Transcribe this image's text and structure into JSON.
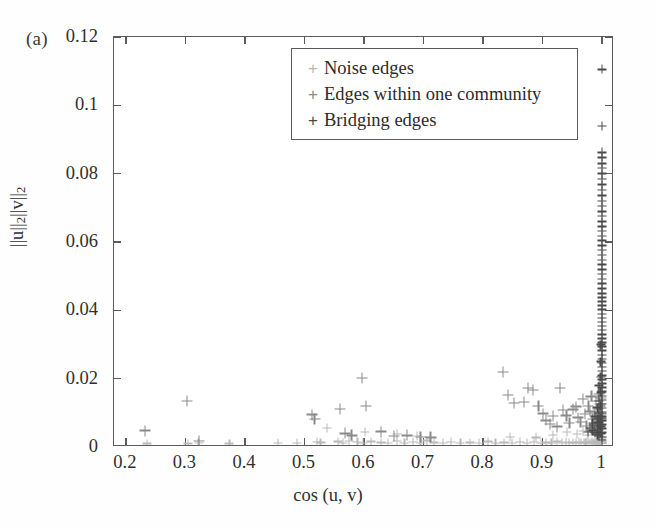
{
  "panel": {
    "letter": "(a)"
  },
  "chart_data": {
    "type": "scatter",
    "title": "",
    "xlabel": "cos (u, v)",
    "ylabel": "||u||2||v||2",
    "xlim": [
      0.18,
      1.02
    ],
    "ylim": [
      0,
      0.12
    ],
    "grid": false,
    "legend_position": "top-center",
    "xticks": [
      "0.2",
      "0.3",
      "0.4",
      "0.5",
      "0.6",
      "0.7",
      "0.8",
      "0.9",
      "1"
    ],
    "xtickvalues": [
      0.2,
      0.3,
      0.4,
      0.5,
      0.6,
      0.7,
      0.8,
      0.9,
      1.0
    ],
    "yticks": [
      "0",
      "0.02",
      "0.04",
      "0.06",
      "0.08",
      "0.1",
      "0.12"
    ],
    "ytickvalues": [
      0,
      0.02,
      0.04,
      0.06,
      0.08,
      0.1,
      0.12
    ],
    "series": [
      {
        "name": "Noise edges",
        "color": "#b9b9b9",
        "marker": "+",
        "points": [
          [
            0.455,
            0.0012
          ],
          [
            0.488,
            0.0011
          ],
          [
            0.521,
            0.0015
          ],
          [
            0.527,
            0.0013
          ],
          [
            0.556,
            0.0016
          ],
          [
            0.565,
            0.0012
          ],
          [
            0.575,
            0.0018
          ],
          [
            0.589,
            0.0014
          ],
          [
            0.598,
            0.0011
          ],
          [
            0.612,
            0.0016
          ],
          [
            0.628,
            0.0013
          ],
          [
            0.641,
            0.0012
          ],
          [
            0.655,
            0.0017
          ],
          [
            0.668,
            0.0012
          ],
          [
            0.682,
            0.0014
          ],
          [
            0.695,
            0.0011
          ],
          [
            0.706,
            0.0019
          ],
          [
            0.718,
            0.0013
          ],
          [
            0.733,
            0.0012
          ],
          [
            0.746,
            0.0015
          ],
          [
            0.762,
            0.0011
          ],
          [
            0.778,
            0.0013
          ],
          [
            0.793,
            0.0012
          ],
          [
            0.808,
            0.0016
          ],
          [
            0.821,
            0.0012
          ],
          [
            0.835,
            0.0013
          ],
          [
            0.849,
            0.0011
          ],
          [
            0.862,
            0.0015
          ],
          [
            0.874,
            0.0012
          ],
          [
            0.886,
            0.0014
          ],
          [
            0.897,
            0.0011
          ],
          [
            0.906,
            0.0013
          ],
          [
            0.915,
            0.0012
          ],
          [
            0.924,
            0.0016
          ],
          [
            0.932,
            0.0012
          ],
          [
            0.939,
            0.0014
          ],
          [
            0.945,
            0.0011
          ],
          [
            0.951,
            0.0013
          ],
          [
            0.956,
            0.0012
          ],
          [
            0.961,
            0.0015
          ],
          [
            0.965,
            0.0011
          ],
          [
            0.969,
            0.0013
          ],
          [
            0.972,
            0.0012
          ],
          [
            0.975,
            0.0014
          ],
          [
            0.978,
            0.0011
          ],
          [
            0.981,
            0.0012
          ],
          [
            0.983,
            0.0016
          ],
          [
            0.985,
            0.0012
          ],
          [
            0.987,
            0.0013
          ],
          [
            0.989,
            0.0011
          ],
          [
            0.991,
            0.0014
          ],
          [
            0.992,
            0.0012
          ],
          [
            0.993,
            0.0017
          ],
          [
            0.994,
            0.0012
          ],
          [
            0.995,
            0.0013
          ],
          [
            0.996,
            0.0011
          ],
          [
            0.9965,
            0.0019
          ],
          [
            0.997,
            0.0012
          ],
          [
            0.9975,
            0.0015
          ],
          [
            0.998,
            0.0011
          ],
          [
            0.9985,
            0.0022
          ],
          [
            0.999,
            0.0013
          ],
          [
            0.9993,
            0.0011
          ],
          [
            0.9996,
            0.0026
          ],
          [
            0.9998,
            0.0014
          ],
          [
            1.0,
            0.0011
          ],
          [
            1.0,
            0.0018
          ],
          [
            1.0,
            0.003
          ],
          [
            0.236,
            0.001
          ],
          [
            0.305,
            0.001
          ],
          [
            0.322,
            0.0011
          ],
          [
            0.374,
            0.001
          ],
          [
            0.538,
            0.0055
          ],
          [
            0.601,
            0.0045
          ],
          [
            0.655,
            0.0039
          ],
          [
            0.689,
            0.0033
          ],
          [
            0.845,
            0.003
          ],
          [
            0.889,
            0.0028
          ],
          [
            0.918,
            0.0035
          ],
          [
            0.941,
            0.0043
          ],
          [
            0.958,
            0.0038
          ],
          [
            0.968,
            0.0046
          ],
          [
            0.976,
            0.0034
          ],
          [
            0.983,
            0.0052
          ]
        ]
      },
      {
        "name": "Edges within one community",
        "color": "#8a8a8a",
        "marker": "+",
        "points": [
          [
            0.232,
            0.0048
          ],
          [
            0.303,
            0.0134
          ],
          [
            0.323,
            0.0018
          ],
          [
            0.513,
            0.0095
          ],
          [
            0.517,
            0.0082
          ],
          [
            0.56,
            0.0112
          ],
          [
            0.568,
            0.004
          ],
          [
            0.579,
            0.0034
          ],
          [
            0.597,
            0.0202
          ],
          [
            0.603,
            0.012
          ],
          [
            0.629,
            0.0045
          ],
          [
            0.65,
            0.0032
          ],
          [
            0.672,
            0.0034
          ],
          [
            0.695,
            0.003
          ],
          [
            0.712,
            0.0028
          ],
          [
            0.833,
            0.022
          ],
          [
            0.842,
            0.0152
          ],
          [
            0.852,
            0.0128
          ],
          [
            0.869,
            0.0132
          ],
          [
            0.876,
            0.0172
          ],
          [
            0.884,
            0.0166
          ],
          [
            0.893,
            0.012
          ],
          [
            0.901,
            0.0098
          ],
          [
            0.906,
            0.0078
          ],
          [
            0.912,
            0.0068
          ],
          [
            0.918,
            0.009
          ],
          [
            0.924,
            0.006
          ],
          [
            0.929,
            0.0172
          ],
          [
            0.934,
            0.0108
          ],
          [
            0.94,
            0.0092
          ],
          [
            0.945,
            0.007
          ],
          [
            0.951,
            0.011
          ],
          [
            0.956,
            0.0118
          ],
          [
            0.96,
            0.0086
          ],
          [
            0.964,
            0.0074
          ],
          [
            0.968,
            0.014
          ],
          [
            0.971,
            0.0096
          ],
          [
            0.974,
            0.0062
          ],
          [
            0.977,
            0.012
          ],
          [
            0.98,
            0.0104
          ],
          [
            0.982,
            0.0148
          ],
          [
            0.984,
            0.0082
          ],
          [
            0.986,
            0.0066
          ],
          [
            0.988,
            0.01
          ],
          [
            0.99,
            0.0134
          ],
          [
            0.991,
            0.0088
          ],
          [
            0.992,
            0.0072
          ],
          [
            0.993,
            0.0112
          ],
          [
            0.994,
            0.0156
          ],
          [
            0.995,
            0.0094
          ],
          [
            0.996,
            0.0076
          ],
          [
            0.9965,
            0.0126
          ],
          [
            0.997,
            0.0064
          ],
          [
            0.9975,
            0.0098
          ],
          [
            0.998,
            0.0144
          ],
          [
            0.9985,
            0.0084
          ]
        ]
      },
      {
        "name": "Bridging edges",
        "color": "#4a4a4a",
        "marker": "+",
        "points": [
          [
            1.0,
            0.1105
          ],
          [
            1.0,
            0.094
          ],
          [
            1.0,
            0.0862
          ],
          [
            1.0,
            0.0848
          ],
          [
            1.0,
            0.083
          ],
          [
            1.0,
            0.0816
          ],
          [
            1.0,
            0.08
          ],
          [
            1.0,
            0.0784
          ],
          [
            1.0,
            0.0768
          ],
          [
            1.0,
            0.0752
          ],
          [
            1.0,
            0.0736
          ],
          [
            1.0,
            0.072
          ],
          [
            1.0,
            0.0706
          ],
          [
            1.0,
            0.069
          ],
          [
            1.0,
            0.0676
          ],
          [
            1.0,
            0.066
          ],
          [
            1.0,
            0.0646
          ],
          [
            1.0,
            0.0632
          ],
          [
            1.0,
            0.0618
          ],
          [
            1.0,
            0.0604
          ],
          [
            1.0,
            0.059
          ],
          [
            1.0,
            0.0576
          ],
          [
            1.0,
            0.0562
          ],
          [
            1.0,
            0.0548
          ],
          [
            1.0,
            0.0534
          ],
          [
            1.0,
            0.052
          ],
          [
            1.0,
            0.0506
          ],
          [
            1.0,
            0.0492
          ],
          [
            1.0,
            0.0478
          ],
          [
            1.0,
            0.0464
          ],
          [
            1.0,
            0.045
          ],
          [
            1.0,
            0.0438
          ],
          [
            1.0,
            0.0426
          ],
          [
            1.0,
            0.0414
          ],
          [
            1.0,
            0.0402
          ],
          [
            1.0,
            0.039
          ],
          [
            1.0,
            0.0378
          ],
          [
            1.0,
            0.0366
          ],
          [
            1.0,
            0.0354
          ],
          [
            1.0,
            0.0342
          ],
          [
            1.0,
            0.033
          ],
          [
            1.0,
            0.0318
          ],
          [
            1.0,
            0.0306
          ],
          [
            1.0,
            0.0294
          ],
          [
            1.0,
            0.0282
          ],
          [
            1.0,
            0.027
          ],
          [
            1.0,
            0.0258
          ],
          [
            1.0,
            0.0246
          ],
          [
            1.0,
            0.0234
          ],
          [
            1.0,
            0.0222
          ],
          [
            1.0,
            0.021
          ],
          [
            1.0,
            0.0198
          ],
          [
            1.0,
            0.0186
          ],
          [
            1.0,
            0.0174
          ],
          [
            1.0,
            0.0162
          ],
          [
            1.0,
            0.015
          ],
          [
            1.0,
            0.0138
          ],
          [
            1.0,
            0.0126
          ],
          [
            1.0,
            0.0114
          ],
          [
            1.0,
            0.0102
          ],
          [
            1.0,
            0.009
          ],
          [
            1.0,
            0.0078
          ],
          [
            1.0,
            0.0066
          ],
          [
            1.0,
            0.0054
          ],
          [
            1.0,
            0.0042
          ],
          [
            1.0,
            0.003
          ],
          [
            1.0,
            0.002
          ],
          [
            0.9975,
            0.03
          ],
          [
            0.9975,
            0.025
          ],
          [
            0.9975,
            0.0205
          ],
          [
            0.9975,
            0.016
          ],
          [
            0.9975,
            0.012
          ],
          [
            0.9975,
            0.0085
          ],
          [
            0.9975,
            0.006
          ],
          [
            0.9975,
            0.004
          ],
          [
            0.995,
            0.018
          ],
          [
            0.995,
            0.0135
          ],
          [
            0.995,
            0.01
          ],
          [
            0.995,
            0.0072
          ],
          [
            0.995,
            0.005
          ],
          [
            0.995,
            0.0032
          ],
          [
            0.992,
            0.0115
          ],
          [
            0.992,
            0.0082
          ],
          [
            0.992,
            0.0056
          ],
          [
            0.992,
            0.0036
          ],
          [
            0.988,
            0.009
          ],
          [
            0.988,
            0.0062
          ],
          [
            0.988,
            0.0042
          ],
          [
            0.984,
            0.007
          ],
          [
            0.984,
            0.0048
          ],
          [
            0.98,
            0.0056
          ],
          [
            0.976,
            0.0044
          ]
        ]
      }
    ]
  },
  "legend": {
    "entries": [
      {
        "label": "Noise edges",
        "marker": "+",
        "color": "#b9b9b9"
      },
      {
        "label": "Edges within one community",
        "marker": "+",
        "color": "#8a8a8a"
      },
      {
        "label": "Bridging edges",
        "marker": "+",
        "color": "#4a4a4a"
      }
    ]
  }
}
